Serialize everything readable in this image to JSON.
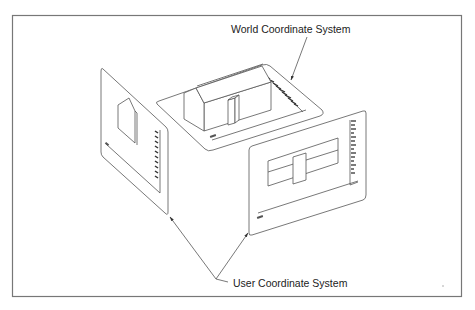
{
  "diagram": {
    "labels": {
      "world": "World Coordinate System",
      "user": "User Coordinate System"
    },
    "nodes": [
      {
        "id": "world-plane",
        "kind": "3D ground plane with house model",
        "label_ref": "world"
      },
      {
        "id": "user-view-left",
        "kind": "projected view panel (side elevation)",
        "label_ref": "user"
      },
      {
        "id": "user-view-right",
        "kind": "projected view panel (front elevation)",
        "label_ref": "user"
      }
    ],
    "edges": [
      {
        "from": "world-label",
        "to": "world-plane",
        "type": "arrow"
      },
      {
        "from": "user-label",
        "to": "user-view-left",
        "type": "arrow"
      },
      {
        "from": "user-label",
        "to": "user-view-right",
        "type": "arrow"
      }
    ],
    "colors": {
      "line": "#555555",
      "frame": "#777777",
      "text": "#222222",
      "background": "#ffffff"
    }
  }
}
